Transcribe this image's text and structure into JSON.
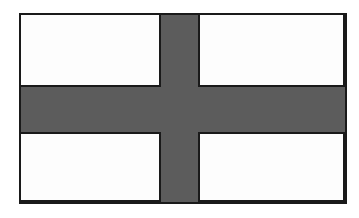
{
  "image": {
    "subject": "nordic-cross-flag",
    "title": "Flag with off-centre cross",
    "width": 359,
    "height": 218,
    "background_color": "#ffffff"
  },
  "flag": {
    "name": "nordic-cross-flag",
    "field_color": "#fdfdfd",
    "cross_color": "#5c5c5c",
    "outline_color": "#1a1a1a",
    "outline_width_px": 2,
    "bounds": {
      "x": 19,
      "y": 13,
      "width": 328,
      "height": 191
    },
    "cross": {
      "style": "nordic-cross",
      "vertical_bar": {
        "x": 163,
        "y": 13,
        "width": 35,
        "height": 191
      },
      "horizontal_bar": {
        "x": 19,
        "y": 89,
        "width": 328,
        "height": 43
      },
      "offset": "hoist-side"
    },
    "panels": [
      {
        "name": "top-left",
        "x": 19,
        "y": 13,
        "width": 144,
        "height": 76,
        "color": "#fdfdfd"
      },
      {
        "name": "top-right",
        "x": 198,
        "y": 13,
        "width": 149,
        "height": 76,
        "color": "#fdfdfd"
      },
      {
        "name": "bottom-left",
        "x": 19,
        "y": 132,
        "width": 144,
        "height": 72,
        "color": "#fdfdfd"
      },
      {
        "name": "bottom-right",
        "x": 198,
        "y": 132,
        "width": 149,
        "height": 72,
        "color": "#fdfdfd"
      }
    ]
  }
}
